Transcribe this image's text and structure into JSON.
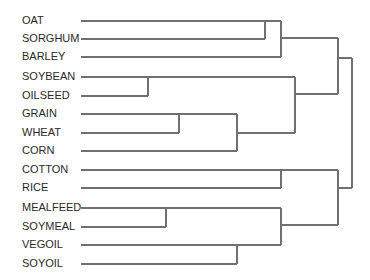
{
  "diagram": {
    "type": "dendrogram",
    "line_color": "#707070",
    "text_color": "#2a2a2a",
    "leaf_line_start_x": 81,
    "leaves": [
      {
        "label": "OAT",
        "y": 21
      },
      {
        "label": "SORGHUM",
        "y": 39
      },
      {
        "label": "BARLEY",
        "y": 57
      },
      {
        "label": "SOYBEAN",
        "y": 77
      },
      {
        "label": "OILSEED",
        "y": 96
      },
      {
        "label": "GRAIN",
        "y": 114
      },
      {
        "label": "WHEAT",
        "y": 133
      },
      {
        "label": "CORN",
        "y": 151
      },
      {
        "label": "COTTON",
        "y": 170
      },
      {
        "label": "RICE",
        "y": 188
      },
      {
        "label": "MEALFEED",
        "y": 208
      },
      {
        "label": "SOYMEAL",
        "y": 227
      },
      {
        "label": "VEGOIL",
        "y": 245
      },
      {
        "label": "SOYOIL",
        "y": 264
      }
    ],
    "clusters": [
      {
        "members": [
          "OAT",
          "SORGHUM"
        ],
        "merge_x": 265
      },
      {
        "members": [
          "OAT",
          "SORGHUM",
          "BARLEY"
        ],
        "merge_x": 281
      },
      {
        "members": [
          "SOYBEAN",
          "OILSEED"
        ],
        "merge_x": 148
      },
      {
        "members": [
          "GRAIN",
          "WHEAT"
        ],
        "merge_x": 179
      },
      {
        "members": [
          "GRAIN",
          "WHEAT",
          "CORN"
        ],
        "merge_x": 237
      },
      {
        "members": [
          "SOYBEAN",
          "OILSEED",
          "GRAIN",
          "WHEAT",
          "CORN"
        ],
        "merge_x": 295
      },
      {
        "members": [
          "OAT",
          "SORGHUM",
          "BARLEY",
          "SOYBEAN",
          "OILSEED",
          "GRAIN",
          "WHEAT",
          "CORN"
        ],
        "merge_x": 338
      },
      {
        "members": [
          "COTTON",
          "RICE"
        ],
        "merge_x": 281
      },
      {
        "members": [
          "MEALFEED",
          "SOYMEAL"
        ],
        "merge_x": 166
      },
      {
        "members": [
          "VEGOIL",
          "SOYOIL"
        ],
        "merge_x": 237
      },
      {
        "members": [
          "MEALFEED",
          "SOYMEAL",
          "VEGOIL",
          "SOYOIL"
        ],
        "merge_x": 281
      },
      {
        "members": [
          "COTTON",
          "RICE",
          "MEALFEED",
          "SOYMEAL",
          "VEGOIL",
          "SOYOIL"
        ],
        "merge_x": 338
      },
      {
        "members": [
          "ALL"
        ],
        "merge_x": 352
      }
    ],
    "segments": [
      "M81 21 H281",
      "M81 39 H265",
      "M265 21 V39",
      "M81 57 H281",
      "M281 21 V57",
      "M281 38 H338",
      "M81 77 H295",
      "M81 96 H148",
      "M148 77 V96",
      "M81 114 H237",
      "M81 133 H179",
      "M179 114 V133",
      "M81 151 H237",
      "M237 114 V151",
      "M237 133 H295",
      "M295 77 V133",
      "M295 94 H338",
      "M338 38 V94",
      "M338 58 H352",
      "M81 170 H338",
      "M81 188 H281",
      "M281 170 V188",
      "M81 208 H281",
      "M81 227 H166",
      "M166 208 V227",
      "M81 245 H281",
      "M81 264 H237",
      "M237 245 V264",
      "M281 208 V245",
      "M281 225 H338",
      "M338 170 V225",
      "M338 188 H352",
      "M352 58 V188"
    ]
  }
}
